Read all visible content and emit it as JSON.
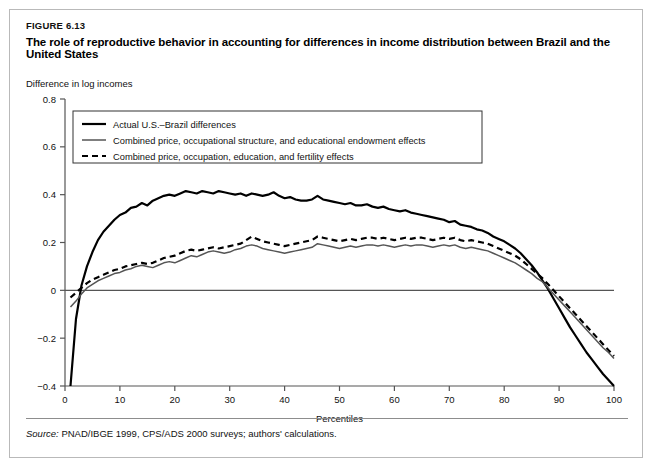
{
  "figure": {
    "label": "FIGURE 6.13",
    "title": "The role of reproductive behavior in accounting for differences in income distribution between Brazil and the United States",
    "source_prefix": "Source:",
    "source_text": "PNAD/IBGE 1999, CPS/ADS 2000 surveys; authors' calculations."
  },
  "chart_data": {
    "type": "line",
    "title": "The role of reproductive behavior in accounting for differences in income distribution between Brazil and the United States",
    "ylabel": "Difference in log incomes",
    "xlabel": "Percentiles",
    "xlim": [
      0,
      100
    ],
    "ylim": [
      -0.4,
      0.8
    ],
    "xticks": [
      0,
      10,
      20,
      30,
      40,
      50,
      60,
      70,
      80,
      90,
      100
    ],
    "xtick_labels": [
      "0",
      "10",
      "20",
      "30",
      "40",
      "50",
      "60",
      "70",
      "80",
      "90",
      "100"
    ],
    "yticks": [
      -0.4,
      -0.2,
      0,
      0.2,
      0.4,
      0.6,
      0.8
    ],
    "ytick_labels": [
      "−0.4",
      "−0.2",
      "0",
      "0.2",
      "0.4",
      "0.6",
      "0.8"
    ],
    "grid": false,
    "zero_line": true,
    "legend_position": "upper-left",
    "colors": {
      "actual": "#000000",
      "combined_peo": "#555555",
      "combined_fertility": "#000000",
      "axis": "#555555",
      "frame": "#b9b9b9"
    },
    "x": [
      1,
      2,
      3,
      4,
      5,
      6,
      7,
      8,
      9,
      10,
      11,
      12,
      13,
      14,
      15,
      16,
      17,
      18,
      19,
      20,
      21,
      22,
      23,
      24,
      25,
      26,
      27,
      28,
      29,
      30,
      31,
      32,
      33,
      34,
      35,
      36,
      37,
      38,
      39,
      40,
      41,
      42,
      43,
      44,
      45,
      46,
      47,
      48,
      49,
      50,
      51,
      52,
      53,
      54,
      55,
      56,
      57,
      58,
      59,
      60,
      61,
      62,
      63,
      64,
      65,
      66,
      67,
      68,
      69,
      70,
      71,
      72,
      73,
      74,
      75,
      76,
      77,
      78,
      79,
      80,
      81,
      82,
      83,
      84,
      85,
      86,
      87,
      88,
      89,
      90,
      91,
      92,
      93,
      94,
      95,
      96,
      97,
      98,
      99,
      100
    ],
    "series": [
      {
        "name": "Actual U.S.–Brazil differences",
        "style": "solid-thick",
        "values": [
          -0.4,
          -0.12,
          0.02,
          0.1,
          0.16,
          0.21,
          0.245,
          0.27,
          0.295,
          0.315,
          0.325,
          0.345,
          0.35,
          0.365,
          0.355,
          0.375,
          0.385,
          0.395,
          0.4,
          0.395,
          0.405,
          0.415,
          0.41,
          0.405,
          0.415,
          0.41,
          0.405,
          0.415,
          0.41,
          0.405,
          0.4,
          0.405,
          0.395,
          0.405,
          0.4,
          0.395,
          0.4,
          0.41,
          0.395,
          0.385,
          0.39,
          0.38,
          0.375,
          0.375,
          0.38,
          0.395,
          0.38,
          0.375,
          0.37,
          0.365,
          0.36,
          0.365,
          0.355,
          0.355,
          0.36,
          0.35,
          0.345,
          0.35,
          0.34,
          0.335,
          0.33,
          0.335,
          0.325,
          0.32,
          0.315,
          0.31,
          0.305,
          0.3,
          0.295,
          0.285,
          0.29,
          0.275,
          0.27,
          0.265,
          0.255,
          0.25,
          0.24,
          0.225,
          0.215,
          0.205,
          0.19,
          0.175,
          0.155,
          0.13,
          0.105,
          0.075,
          0.04,
          0.005,
          -0.035,
          -0.075,
          -0.115,
          -0.155,
          -0.19,
          -0.225,
          -0.26,
          -0.29,
          -0.32,
          -0.35,
          -0.375,
          -0.4
        ]
      },
      {
        "name": "Combined price, occupational structure, and educational endowment effects",
        "style": "solid-thin",
        "values": [
          -0.07,
          -0.045,
          -0.015,
          0.01,
          0.025,
          0.04,
          0.05,
          0.06,
          0.07,
          0.075,
          0.085,
          0.09,
          0.1,
          0.105,
          0.1,
          0.095,
          0.105,
          0.115,
          0.12,
          0.115,
          0.125,
          0.135,
          0.145,
          0.14,
          0.15,
          0.16,
          0.165,
          0.16,
          0.155,
          0.16,
          0.17,
          0.175,
          0.185,
          0.19,
          0.185,
          0.175,
          0.17,
          0.165,
          0.16,
          0.155,
          0.16,
          0.165,
          0.17,
          0.175,
          0.18,
          0.195,
          0.19,
          0.185,
          0.18,
          0.175,
          0.18,
          0.185,
          0.18,
          0.185,
          0.19,
          0.19,
          0.185,
          0.19,
          0.185,
          0.18,
          0.185,
          0.19,
          0.185,
          0.19,
          0.19,
          0.185,
          0.18,
          0.185,
          0.19,
          0.185,
          0.19,
          0.18,
          0.175,
          0.18,
          0.175,
          0.17,
          0.165,
          0.155,
          0.145,
          0.135,
          0.125,
          0.115,
          0.1,
          0.085,
          0.07,
          0.05,
          0.035,
          0.01,
          -0.015,
          -0.04,
          -0.065,
          -0.09,
          -0.115,
          -0.14,
          -0.165,
          -0.19,
          -0.215,
          -0.24,
          -0.26,
          -0.285
        ]
      },
      {
        "name": "Combined price, occupation, education, and fertility effects",
        "style": "dashed",
        "values": [
          -0.03,
          -0.01,
          0.01,
          0.03,
          0.045,
          0.055,
          0.065,
          0.075,
          0.085,
          0.09,
          0.1,
          0.105,
          0.11,
          0.115,
          0.11,
          0.115,
          0.125,
          0.135,
          0.14,
          0.145,
          0.155,
          0.165,
          0.17,
          0.165,
          0.17,
          0.175,
          0.18,
          0.175,
          0.18,
          0.185,
          0.19,
          0.195,
          0.21,
          0.225,
          0.215,
          0.205,
          0.2,
          0.195,
          0.19,
          0.185,
          0.19,
          0.195,
          0.2,
          0.205,
          0.21,
          0.225,
          0.22,
          0.215,
          0.21,
          0.205,
          0.21,
          0.215,
          0.21,
          0.215,
          0.22,
          0.22,
          0.215,
          0.22,
          0.215,
          0.21,
          0.215,
          0.22,
          0.215,
          0.22,
          0.22,
          0.215,
          0.21,
          0.215,
          0.22,
          0.215,
          0.22,
          0.21,
          0.205,
          0.21,
          0.205,
          0.2,
          0.195,
          0.185,
          0.175,
          0.165,
          0.155,
          0.145,
          0.13,
          0.11,
          0.09,
          0.07,
          0.05,
          0.025,
          0.0,
          -0.025,
          -0.05,
          -0.075,
          -0.1,
          -0.125,
          -0.15,
          -0.175,
          -0.2,
          -0.225,
          -0.25,
          -0.275
        ]
      }
    ],
    "legend": [
      {
        "label": "Actual U.S.–Brazil differences",
        "style": "solid-thick"
      },
      {
        "label": "Combined price, occupational structure, and educational endowment effects",
        "style": "solid-thin"
      },
      {
        "label": "Combined price, occupation, education, and fertility effects",
        "style": "dashed"
      }
    ]
  }
}
